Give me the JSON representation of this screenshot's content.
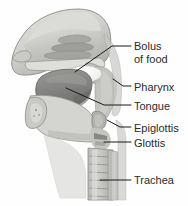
{
  "figure": {
    "background_color": "#fefefe",
    "label_color": "#2b2b2b",
    "leader_line_color": "#1a1a1a",
    "width": 188,
    "height": 206
  },
  "labels": [
    {
      "id": "bolus",
      "line1": "Bolus",
      "line2": "of food",
      "x": 134,
      "y": 40
    },
    {
      "id": "pharynx",
      "line1": "Pharynx",
      "line2": "",
      "x": 134,
      "y": 81
    },
    {
      "id": "tongue",
      "line1": "Tongue",
      "line2": "",
      "x": 134,
      "y": 100
    },
    {
      "id": "epiglottis",
      "line1": "Epiglottis",
      "line2": "",
      "x": 134,
      "y": 122
    },
    {
      "id": "glottis",
      "line1": "Glottis",
      "line2": "",
      "x": 134,
      "y": 137
    },
    {
      "id": "trachea",
      "line1": "Trachea",
      "line2": "",
      "x": 134,
      "y": 174
    }
  ],
  "structures": {
    "nasal_cavity": "nasal cavity with turbinates",
    "hard_palate": "hard palate",
    "soft_palate": "soft palate",
    "bolus": "bolus of food",
    "tongue": "tongue",
    "pharynx": "pharynx",
    "epiglottis": "epiglottis",
    "glottis": "glottis",
    "trachea": "trachea",
    "mandible": "mandible",
    "esophagus": "esophagus"
  },
  "palette": {
    "outline": "#7d7d7d",
    "skin_light": "#d7d7d4",
    "tissue_mid": "#b4b4b2",
    "tissue_dark": "#8e8e8c",
    "tongue": "#8a8a88",
    "bolus": "#f4f4f1",
    "cartilage": "#c6c6c3",
    "shadow": "#6e6e6c"
  }
}
